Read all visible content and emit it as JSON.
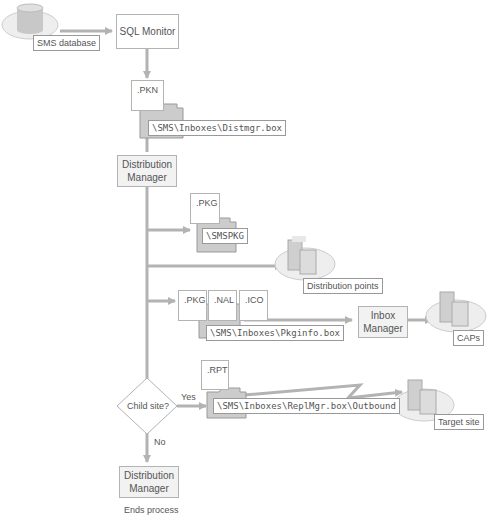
{
  "nodes": {
    "sms_database": "SMS database",
    "sql_monitor": "SQL Monitor",
    "pkn_file": ".PKN",
    "distmgr_box": "\\SMS\\Inboxes\\Distmgr.box",
    "distribution_manager_1": "Distribution Manager",
    "pkg_file_1": ".PKG",
    "smspkg": "\\SMSPKG",
    "distribution_points": "Distribution points",
    "pkg_file_2": ".PKG",
    "nal_file": ".NAL",
    "ico_file": ".ICO",
    "pkginfo_box": "\\SMS\\Inboxes\\Pkginfo.box",
    "inbox_manager": "Inbox Manager",
    "caps": "CAPs",
    "rpt_file": ".RPT",
    "replmgr_outbound": "\\SMS\\Inboxes\\ReplMgr.box\\Outbound",
    "target_site": "Target site",
    "child_site_decision": "Child site?",
    "yes_label": "Yes",
    "no_label": "No",
    "distribution_manager_2": "Distribution Manager",
    "ends_process": "Ends process"
  },
  "colors": {
    "line": "#b3b3b3",
    "folder_fill": "#cccccc",
    "folder_stroke": "#999999",
    "server_fill": "#d9d9d9",
    "ellipse_fill": "#eeeeee"
  }
}
